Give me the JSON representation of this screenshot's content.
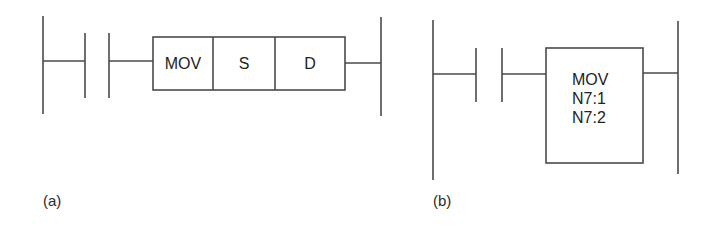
{
  "diagram_a": {
    "label": "(a)",
    "instruction": {
      "opcode": "MOV",
      "source": "S",
      "destination": "D"
    }
  },
  "diagram_b": {
    "label": "(b)",
    "instruction": {
      "opcode": "MOV",
      "source": "N7:1",
      "destination": "N7:2"
    }
  },
  "colors": {
    "line": "#4a4a4a",
    "text": "#222222",
    "background": "#ffffff"
  }
}
